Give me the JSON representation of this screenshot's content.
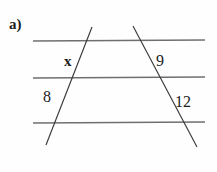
{
  "figure": {
    "problem_label": "a)",
    "background_color": "#fefefe",
    "horizontal_line_color": "#6f6f6f",
    "transversal_line_color": "#3a3a3a",
    "text_color": "#1c1c1c",
    "labels": {
      "x": "x",
      "eight": "8",
      "nine": "9",
      "twelve": "12"
    },
    "geometry": {
      "type": "parallel-lines-with-transversals",
      "horizontal_lines": [
        {
          "name": "top-parallel-line",
          "x1": 33,
          "y1": 41,
          "x2": 205,
          "y2": 40
        },
        {
          "name": "middle-parallel-line",
          "x1": 33,
          "y1": 78,
          "x2": 205,
          "y2": 77
        },
        {
          "name": "bottom-parallel-line",
          "x1": 33,
          "y1": 123,
          "x2": 205,
          "y2": 122
        }
      ],
      "transversals": [
        {
          "name": "left-transversal",
          "x1": 92,
          "y1": 27,
          "x2": 46,
          "y2": 145
        },
        {
          "name": "right-transversal",
          "x1": 133,
          "y1": 26,
          "x2": 197,
          "y2": 147
        }
      ]
    }
  }
}
